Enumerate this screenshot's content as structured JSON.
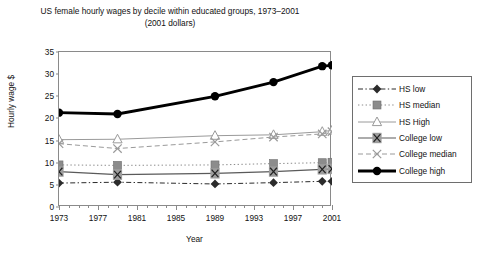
{
  "chart_data": {
    "type": "line",
    "title": "US female hourly wages  by decile within educated groups, 1973–2001",
    "subtitle": "(2001 dollars)",
    "xlabel": "Year",
    "ylabel": "Hourly wage $",
    "xlim": [
      1973,
      2001
    ],
    "ylim": [
      0,
      35
    ],
    "yticks": [
      0,
      5,
      10,
      15,
      20,
      25,
      30,
      35
    ],
    "xticks": [
      1973,
      1977,
      1981,
      1985,
      1989,
      1993,
      1997,
      2001
    ],
    "x_minor_tick_interval": 1,
    "grid": false,
    "legend_position": "right",
    "x": [
      1973,
      1979,
      1989,
      1995,
      2000,
      2001
    ],
    "series": [
      {
        "name": "HS low",
        "marker": "diamond",
        "line": "dash-dot",
        "color": "#2b2b2b",
        "width": 1,
        "values": [
          5.4,
          5.6,
          5.2,
          5.5,
          5.8,
          5.8
        ]
      },
      {
        "name": "HS median",
        "marker": "square",
        "line": "dotted",
        "color": "#8c8c8c",
        "width": 1,
        "values": [
          9.5,
          9.4,
          9.5,
          9.8,
          10.0,
          10.1
        ]
      },
      {
        "name": "HS High",
        "marker": "triangle",
        "line": "solid",
        "color": "#9a9a9a",
        "width": 1,
        "values": [
          15.2,
          15.3,
          16.1,
          16.3,
          17.0,
          17.3
        ]
      },
      {
        "name": "College low",
        "marker": "boxed-x",
        "line": "solid",
        "color": "#5a5a5a",
        "width": 1.2,
        "values": [
          8.0,
          7.3,
          7.6,
          8.0,
          8.5,
          8.6
        ]
      },
      {
        "name": "College median",
        "marker": "x",
        "line": "dashed",
        "color": "#9a9a9a",
        "width": 1,
        "values": [
          14.3,
          13.2,
          14.7,
          15.8,
          16.5,
          17.0
        ]
      },
      {
        "name": "College high",
        "marker": "circle",
        "line": "solid",
        "color": "#000000",
        "width": 2.8,
        "values": [
          21.3,
          21.0,
          25.0,
          28.2,
          31.8,
          32.0
        ]
      }
    ]
  },
  "legend": {
    "items": [
      {
        "label": "HS low"
      },
      {
        "label": "HS median"
      },
      {
        "label": "HS High"
      },
      {
        "label": "College low"
      },
      {
        "label": "College median"
      },
      {
        "label": "College high"
      }
    ]
  }
}
